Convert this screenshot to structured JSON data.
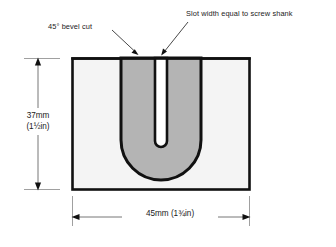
{
  "diagram": {
    "callouts": [
      {
        "id": "bevel",
        "text": "45° bevel cut",
        "name": "callout-bevel-cut"
      },
      {
        "id": "slot",
        "text": "Slot width equal to screw shank",
        "name": "callout-slot-width"
      }
    ],
    "dimensions": {
      "height": {
        "metric": "37mm",
        "imperial": "(1½in)",
        "orientation": "vertical"
      },
      "width": {
        "metric_imperial": "45mm (1¾in)",
        "orientation": "horizontal"
      }
    },
    "colors": {
      "outline": "#111111",
      "panel_fill": "#f4f4f4",
      "bevel_fill": "#b4b4b4",
      "slot_fill": "#ffffff",
      "dimension_line": "#555555",
      "text": "#1a1a1a"
    },
    "geometry": {
      "panel": {
        "x": 72,
        "y": 58,
        "width": 178,
        "height": 132
      },
      "slot_center_x": 161,
      "bevel_outer_half_width": 40,
      "slot_half_width": 6
    }
  }
}
